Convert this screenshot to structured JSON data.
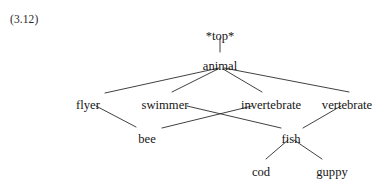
{
  "figure": {
    "equation_number": "(3.12)",
    "equation_number_pos": {
      "x": 10,
      "y": 13
    },
    "width": 389,
    "height": 179,
    "background_color": "#ffffff",
    "line_color": "#2b2b2b",
    "text_color": "#161616"
  },
  "chart_data": {
    "type": "diagram",
    "diagram_kind": "type-hierarchy-lattice",
    "title": "(3.12)",
    "nodes": [
      {
        "id": "top",
        "label": "*top*",
        "x": 220,
        "y": 30,
        "level": 0
      },
      {
        "id": "animal",
        "label": "animal",
        "x": 220,
        "y": 60,
        "level": 1
      },
      {
        "id": "flyer",
        "label": "flyer",
        "x": 88,
        "y": 99,
        "level": 2
      },
      {
        "id": "swimmer",
        "label": "swimmer",
        "x": 165,
        "y": 99,
        "level": 2
      },
      {
        "id": "invertebrate",
        "label": "invertebrate",
        "x": 271,
        "y": 99,
        "level": 2
      },
      {
        "id": "vertebrate",
        "label": "vertebrate",
        "x": 347,
        "y": 99,
        "level": 2
      },
      {
        "id": "bee",
        "label": "bee",
        "x": 147,
        "y": 133,
        "level": 3
      },
      {
        "id": "fish",
        "label": "fish",
        "x": 291,
        "y": 133,
        "level": 3
      },
      {
        "id": "cod",
        "label": "cod",
        "x": 261,
        "y": 166,
        "level": 4
      },
      {
        "id": "guppy",
        "label": "guppy",
        "x": 332,
        "y": 166,
        "level": 4
      }
    ],
    "edges": [
      {
        "from": "top",
        "to": "animal",
        "x1": 220,
        "y1": 38,
        "x2": 220,
        "y2": 52
      },
      {
        "from": "animal",
        "to": "flyer",
        "x1": 219,
        "y1": 68,
        "x2": 105,
        "y2": 93
      },
      {
        "from": "animal",
        "to": "swimmer",
        "x1": 218,
        "y1": 69,
        "x2": 172,
        "y2": 92
      },
      {
        "from": "animal",
        "to": "invertebrate",
        "x1": 223,
        "y1": 69,
        "x2": 262,
        "y2": 92
      },
      {
        "from": "animal",
        "to": "vertebrate",
        "x1": 224,
        "y1": 68,
        "x2": 349,
        "y2": 92
      },
      {
        "from": "flyer",
        "to": "bee",
        "x1": 96,
        "y1": 106,
        "x2": 136,
        "y2": 127
      },
      {
        "from": "swimmer",
        "to": "fish",
        "x1": 187,
        "y1": 106,
        "x2": 281,
        "y2": 128
      },
      {
        "from": "invertebrate",
        "to": "bee",
        "x1": 252,
        "y1": 106,
        "x2": 162,
        "y2": 128
      },
      {
        "from": "vertebrate",
        "to": "fish",
        "x1": 341,
        "y1": 106,
        "x2": 303,
        "y2": 128
      },
      {
        "from": "fish",
        "to": "cod",
        "x1": 288,
        "y1": 140,
        "x2": 266,
        "y2": 159
      },
      {
        "from": "fish",
        "to": "guppy",
        "x1": 294,
        "y1": 140,
        "x2": 322,
        "y2": 159
      }
    ],
    "node_count": 10,
    "edge_count": 11
  }
}
